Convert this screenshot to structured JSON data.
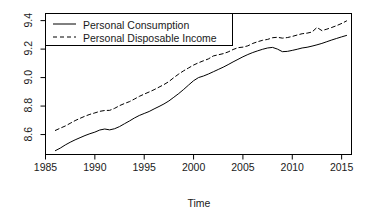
{
  "chart_data": {
    "type": "line",
    "title": "",
    "xlabel": "Time",
    "ylabel": "",
    "xlim": [
      1985,
      2016
    ],
    "ylim": [
      8.46,
      9.45
    ],
    "grid": false,
    "legend_position": "top-left",
    "xticks": [
      1985,
      1990,
      1995,
      2000,
      2005,
      2010,
      2015
    ],
    "xtick_labels": [
      "1985",
      "1990",
      "1995",
      "2000",
      "2005",
      "2010",
      "2015"
    ],
    "yticks": [
      8.6,
      8.8,
      9.0,
      9.2,
      9.4
    ],
    "ytick_labels": [
      "8.6",
      "8.8",
      "9.0",
      "9.2",
      "9.4"
    ],
    "x": [
      1986.0,
      1986.5,
      1987.0,
      1987.5,
      1988.0,
      1988.5,
      1989.0,
      1989.5,
      1990.0,
      1990.5,
      1991.0,
      1991.5,
      1992.0,
      1992.5,
      1993.0,
      1993.5,
      1994.0,
      1994.5,
      1995.0,
      1995.5,
      1996.0,
      1996.5,
      1997.0,
      1997.5,
      1998.0,
      1998.5,
      1999.0,
      1999.5,
      2000.0,
      2000.5,
      2001.0,
      2001.5,
      2002.0,
      2002.5,
      2003.0,
      2003.5,
      2004.0,
      2004.5,
      2005.0,
      2005.5,
      2006.0,
      2006.5,
      2007.0,
      2007.5,
      2008.0,
      2008.5,
      2009.0,
      2009.5,
      2010.0,
      2010.5,
      2011.0,
      2011.5,
      2012.0,
      2012.5,
      2013.0,
      2013.5,
      2014.0,
      2014.5,
      2015.0,
      2015.5
    ],
    "series": [
      {
        "name": "Personal Consumption",
        "style": "solid",
        "color": "#000000",
        "values": [
          8.487,
          8.505,
          8.527,
          8.546,
          8.563,
          8.578,
          8.593,
          8.606,
          8.617,
          8.632,
          8.639,
          8.633,
          8.641,
          8.656,
          8.676,
          8.695,
          8.716,
          8.734,
          8.748,
          8.762,
          8.78,
          8.797,
          8.815,
          8.836,
          8.862,
          8.888,
          8.917,
          8.948,
          8.978,
          9.0,
          9.011,
          9.025,
          9.041,
          9.057,
          9.073,
          9.091,
          9.11,
          9.128,
          9.146,
          9.162,
          9.176,
          9.188,
          9.199,
          9.208,
          9.212,
          9.2,
          9.182,
          9.184,
          9.191,
          9.199,
          9.208,
          9.213,
          9.221,
          9.23,
          9.24,
          9.252,
          9.264,
          9.275,
          9.286,
          9.296
        ]
      },
      {
        "name": "Personal Disposable Income",
        "style": "dashed",
        "color": "#000000",
        "values": [
          8.629,
          8.645,
          8.66,
          8.679,
          8.698,
          8.714,
          8.729,
          8.742,
          8.752,
          8.763,
          8.769,
          8.77,
          8.784,
          8.803,
          8.818,
          8.831,
          8.849,
          8.868,
          8.884,
          8.899,
          8.915,
          8.933,
          8.951,
          8.972,
          9.0,
          9.025,
          9.048,
          9.068,
          9.088,
          9.104,
          9.118,
          9.131,
          9.152,
          9.16,
          9.168,
          9.18,
          9.197,
          9.21,
          9.214,
          9.223,
          9.24,
          9.252,
          9.262,
          9.268,
          9.28,
          9.283,
          9.277,
          9.281,
          9.289,
          9.299,
          9.308,
          9.312,
          9.32,
          9.352,
          9.33,
          9.34,
          9.352,
          9.365,
          9.38,
          9.398
        ]
      }
    ]
  },
  "axes": {
    "x_title": "Time",
    "x_tick_labels": [
      "1985",
      "1990",
      "1995",
      "2000",
      "2005",
      "2010",
      "2015"
    ],
    "y_tick_labels": [
      "8.6",
      "8.8",
      "9.0",
      "9.2",
      "9.4"
    ]
  },
  "legend": {
    "entries": [
      {
        "label": "Personal Consumption",
        "style": "solid"
      },
      {
        "label": "Personal Disposable Income",
        "style": "dashed"
      }
    ]
  },
  "colors": {
    "line": "#000000",
    "axis": "#000000",
    "background": "#ffffff"
  }
}
